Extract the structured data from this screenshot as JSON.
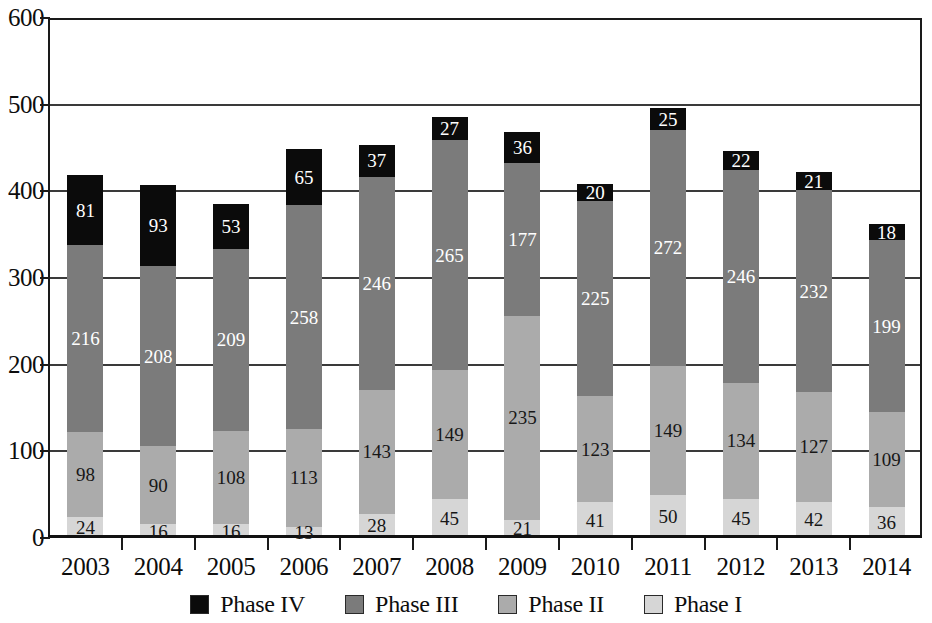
{
  "chart_data": {
    "type": "bar",
    "subtype": "stacked-vertical",
    "title": "",
    "subtitle": "",
    "xlabel": "",
    "ylabel": "",
    "categories": [
      "2003",
      "2004",
      "2005",
      "2006",
      "2007",
      "2008",
      "2009",
      "2010",
      "2011",
      "2012",
      "2013",
      "2014"
    ],
    "series": [
      {
        "name": "Phase I",
        "color": "#d6d6d6",
        "values": [
          24,
          16,
          16,
          13,
          28,
          45,
          21,
          41,
          50,
          45,
          42,
          36
        ]
      },
      {
        "name": "Phase II",
        "color": "#ababab",
        "values": [
          98,
          90,
          108,
          113,
          143,
          149,
          235,
          123,
          149,
          134,
          127,
          109
        ]
      },
      {
        "name": "Phase III",
        "color": "#7b7b7b",
        "values": [
          216,
          208,
          209,
          258,
          246,
          265,
          177,
          225,
          272,
          246,
          232,
          199
        ]
      },
      {
        "name": "Phase IV",
        "color": "#0b0b0b",
        "values": [
          81,
          93,
          53,
          65,
          37,
          27,
          36,
          20,
          25,
          22,
          21,
          18
        ]
      }
    ],
    "stack_order_bottom_to_top": [
      "Phase I",
      "Phase II",
      "Phase III",
      "Phase IV"
    ],
    "totals": [
      419,
      407,
      386,
      449,
      454,
      486,
      469,
      409,
      496,
      447,
      422,
      362
    ],
    "ylim": [
      0,
      600
    ],
    "y_ticks": [
      0,
      100,
      200,
      300,
      400,
      500,
      600
    ],
    "y_tick_labels": [
      "0",
      "100",
      "200",
      "300",
      "400",
      "500",
      "600"
    ],
    "gridlines": true,
    "grid_axis": "y",
    "legend": {
      "position": "bottom",
      "entries": [
        {
          "label": "Phase IV",
          "color": "#0b0b0b"
        },
        {
          "label": "Phase III",
          "color": "#7b7b7b"
        },
        {
          "label": "Phase II",
          "color": "#ababab"
        },
        {
          "label": "Phase I",
          "color": "#d6d6d6"
        }
      ]
    },
    "data_labels": true
  }
}
